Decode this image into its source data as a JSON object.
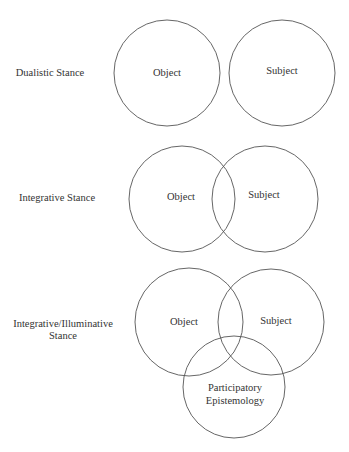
{
  "figure": {
    "caption_clipped": ""
  },
  "rows": [
    {
      "id": "dualistic",
      "stance_label_lines": [
        "Dualistic Stance"
      ],
      "circles": [
        {
          "label_lines": [
            "Object"
          ]
        },
        {
          "label_lines": [
            "Subject"
          ]
        }
      ]
    },
    {
      "id": "integrative",
      "stance_label_lines": [
        "Integrative Stance"
      ],
      "circles": [
        {
          "label_lines": [
            "Object"
          ]
        },
        {
          "label_lines": [
            "Subject"
          ]
        }
      ]
    },
    {
      "id": "integrative-illuminative",
      "stance_label_lines": [
        "Integrative/Illuminative",
        "Stance"
      ],
      "circles": [
        {
          "label_lines": [
            "Object"
          ]
        },
        {
          "label_lines": [
            "Subject"
          ]
        },
        {
          "label_lines": [
            "Participatory",
            "Epistemology"
          ]
        }
      ]
    }
  ],
  "colors": {
    "stroke": "#555555",
    "text": "#333333",
    "background": "#ffffff"
  }
}
